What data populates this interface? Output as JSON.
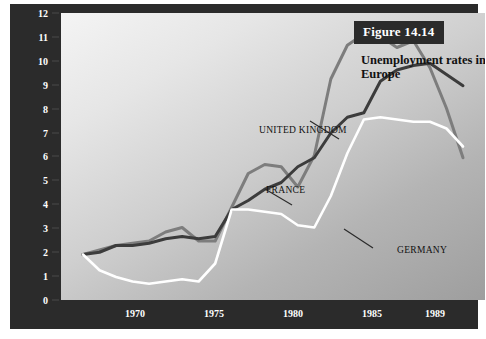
{
  "figure": {
    "number_label": "Figure 14.14",
    "title": "Unemployment rates in Western Europe",
    "y_axis_title": "Unemployment rate (in %)"
  },
  "axes": {
    "y_ticks": [
      "0",
      "1",
      "2",
      "3",
      "4",
      "5",
      "6",
      "7",
      "8",
      "9",
      "10",
      "11",
      "12"
    ],
    "x_ticks": [
      "1970",
      "1975",
      "1980",
      "1985",
      "1989"
    ]
  },
  "series_labels": {
    "uk": "UNITED KINGDOM",
    "france": "FRANCE",
    "germany": "GERMANY"
  },
  "colors": {
    "united_kingdom": "#7d7d7d",
    "france": "#3c3c3c",
    "germany": "#ffffff",
    "axis_bar": "#2b2b2b",
    "tick_text": "#ffffff"
  },
  "chart_data": {
    "type": "line",
    "title": "Unemployment rates in Western Europe",
    "subtitle": "Figure 14.14",
    "xlabel": "",
    "ylabel": "Unemployment rate (in %)",
    "xlim": [
      1966,
      1989
    ],
    "ylim": [
      0,
      12.6
    ],
    "grid": false,
    "legend_position": "inline-annotations",
    "x": [
      1966,
      1967,
      1968,
      1969,
      1970,
      1971,
      1972,
      1973,
      1974,
      1975,
      1976,
      1977,
      1978,
      1979,
      1980,
      1981,
      1982,
      1983,
      1984,
      1985,
      1986,
      1987,
      1988,
      1989
    ],
    "series": [
      {
        "name": "UNITED KINGDOM",
        "color": "#7d7d7d",
        "values": [
          2.0,
          2.2,
          2.4,
          2.5,
          2.6,
          3.0,
          3.2,
          2.6,
          2.6,
          4.1,
          5.6,
          6.0,
          5.9,
          5.0,
          6.4,
          9.8,
          11.3,
          11.8,
          11.7,
          11.2,
          11.5,
          10.3,
          8.5,
          6.3
        ]
      },
      {
        "name": "FRANCE",
        "color": "#3c3c3c",
        "values": [
          2.0,
          2.1,
          2.4,
          2.4,
          2.5,
          2.7,
          2.8,
          2.7,
          2.8,
          4.0,
          4.4,
          4.9,
          5.2,
          5.9,
          6.3,
          7.4,
          8.1,
          8.3,
          9.7,
          10.2,
          10.4,
          10.5,
          10.0,
          9.5
        ]
      },
      {
        "name": "GERMANY",
        "color": "#ffffff",
        "values": [
          2.0,
          1.3,
          1.0,
          0.8,
          0.7,
          0.8,
          0.9,
          0.8,
          1.6,
          4.0,
          4.0,
          3.9,
          3.8,
          3.3,
          3.2,
          4.6,
          6.5,
          8.0,
          8.1,
          8.0,
          7.9,
          7.9,
          7.6,
          6.8
        ]
      }
    ]
  }
}
